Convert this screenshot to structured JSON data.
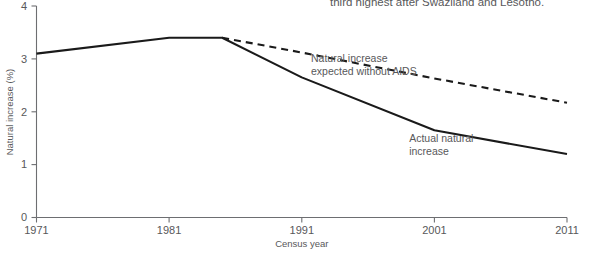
{
  "caption": {
    "line1": "third highest after Swaziland and Lesotho."
  },
  "chart_data": {
    "type": "line",
    "title": "",
    "xlabel": "Census year",
    "ylabel": "Natural increase (%)",
    "xlim": [
      1971,
      2011
    ],
    "ylim": [
      0,
      4
    ],
    "xticks": [
      "1971",
      "1981",
      "1991",
      "2001",
      "2011"
    ],
    "xtick_values": [
      1971,
      1981,
      1991,
      2001,
      2011
    ],
    "yticks": [
      "0",
      "1",
      "2",
      "3",
      "4"
    ],
    "ytick_values": [
      0,
      1,
      2,
      3,
      4
    ],
    "grid": false,
    "legend": "annotations-inline",
    "series": [
      {
        "name": "Actual natural increase",
        "style": "solid",
        "color": "#1a1a1a",
        "x": [
          1971,
          1981,
          1985,
          1991,
          2001,
          2011
        ],
        "values": [
          3.1,
          3.4,
          3.4,
          2.65,
          1.65,
          1.2
        ]
      },
      {
        "name": "Natural increase expected without AIDS",
        "style": "dashed",
        "color": "#1a1a1a",
        "x": [
          1985,
          1991,
          2001,
          2011
        ],
        "values": [
          3.4,
          3.12,
          2.63,
          2.17
        ]
      }
    ],
    "annotations": [
      {
        "id": "expected-label",
        "line1": "Natural increase",
        "line2": "expected without AIDS",
        "x": 1991.7,
        "y": 2.95
      },
      {
        "id": "actual-label",
        "line1": "Actual natural",
        "line2": "increase",
        "x": 1999.1,
        "y": 1.42
      }
    ]
  }
}
